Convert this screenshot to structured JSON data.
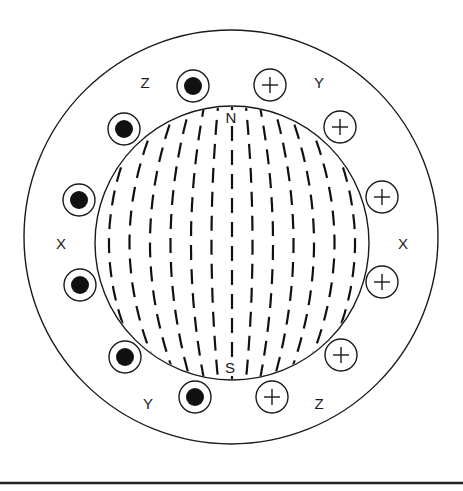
{
  "diagram": {
    "colors": {
      "stroke": "#1a1a1a",
      "background": "#ffffff",
      "fill_dot": "#111111"
    },
    "stator_outer": {
      "cx": 231,
      "cy": 237,
      "r": 207
    },
    "rotor": {
      "cx": 232,
      "cy": 243,
      "r": 137
    },
    "rotor_poles": [
      {
        "label": "N",
        "x": 231,
        "y": 123
      },
      {
        "label": "S",
        "x": 230,
        "y": 373
      }
    ],
    "phase_labels": [
      {
        "label": "Z",
        "x": 145,
        "y": 88
      },
      {
        "label": "Y",
        "x": 319,
        "y": 88
      },
      {
        "label": "X",
        "x": 61,
        "y": 249
      },
      {
        "label": "X",
        "x": 403,
        "y": 249
      },
      {
        "label": "Y",
        "x": 148,
        "y": 409
      },
      {
        "label": "Z",
        "x": 319,
        "y": 409
      }
    ],
    "conductors": [
      {
        "type": "dot",
        "name": "current-out",
        "cx": 193,
        "cy": 86
      },
      {
        "type": "dot",
        "name": "current-out",
        "cx": 124,
        "cy": 129
      },
      {
        "type": "dot",
        "name": "current-out",
        "cx": 79,
        "cy": 200
      },
      {
        "type": "dot",
        "name": "current-out",
        "cx": 80,
        "cy": 285
      },
      {
        "type": "dot",
        "name": "current-out",
        "cx": 125,
        "cy": 357
      },
      {
        "type": "dot",
        "name": "current-out",
        "cx": 195,
        "cy": 397
      },
      {
        "type": "cross",
        "name": "current-in",
        "cx": 270,
        "cy": 85
      },
      {
        "type": "cross",
        "name": "current-in",
        "cx": 340,
        "cy": 127
      },
      {
        "type": "cross",
        "name": "current-in",
        "cx": 382,
        "cy": 197
      },
      {
        "type": "cross",
        "name": "current-in",
        "cx": 382,
        "cy": 282
      },
      {
        "type": "cross",
        "name": "current-in",
        "cx": 341,
        "cy": 355
      },
      {
        "type": "cross",
        "name": "current-in",
        "cx": 272,
        "cy": 397
      }
    ],
    "conductor_radius": 16,
    "dot_radius": 9,
    "field_lines": {
      "style": "dashed",
      "direction": "vertical N to S",
      "count": 13
    },
    "baseline": {
      "y": 483
    }
  }
}
